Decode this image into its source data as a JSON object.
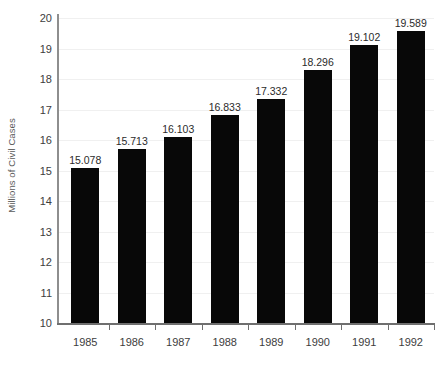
{
  "chart_data": {
    "type": "bar",
    "title": "",
    "subtitle": "",
    "xlabel": "",
    "ylabel": "Millions of Civil Cases",
    "categories": [
      "1985",
      "1986",
      "1987",
      "1988",
      "1989",
      "1990",
      "1991",
      "1992"
    ],
    "values": [
      15.078,
      15.713,
      16.103,
      16.833,
      17.332,
      18.296,
      19.102,
      19.589
    ],
    "value_labels": [
      "15.078",
      "15.713",
      "16.103",
      "16.833",
      "17.332",
      "18.296",
      "19.102",
      "19.589"
    ],
    "ylim": [
      10,
      20
    ],
    "ytick_labels": [
      "20",
      "19",
      "18",
      "17",
      "16",
      "15",
      "14",
      "13",
      "12",
      "11",
      "10"
    ],
    "ytick_values": [
      20,
      19,
      18,
      17,
      16,
      15,
      14,
      13,
      12,
      11,
      10
    ],
    "grid": true,
    "grid_axis": "y",
    "legend": false,
    "legend_position": "none",
    "bar_color": "#080808",
    "axis_color": "#6f6f6f",
    "grid_color": "#f0f0f0",
    "text_color": "#3d3d3d",
    "background_color": "#ffffff",
    "data_labels": true,
    "series": [
      {
        "name": "Civil Cases",
        "values": [
          15.078,
          15.713,
          16.103,
          16.833,
          17.332,
          18.296,
          19.102,
          19.589
        ]
      }
    ]
  },
  "axes": {
    "y_title": "Millions of Civil Cases"
  },
  "footnote": {
    "clipped_text": ""
  }
}
